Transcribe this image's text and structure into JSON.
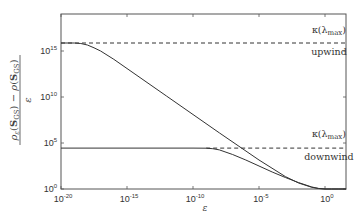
{
  "chart_data": {
    "type": "line",
    "title": "",
    "xlabel": "ε",
    "ylabel": "(ρ_ε(S_GS) − ρ(S_GS)) / ε",
    "xscale": "log",
    "yscale": "log",
    "xlim_exp": [
      -20,
      1.6
    ],
    "ylim_exp": [
      0,
      19
    ],
    "grid": false,
    "x_ticks": [
      {
        "exp": -20,
        "label": "10",
        "sup": "-20"
      },
      {
        "exp": -15,
        "label": "10",
        "sup": "-15"
      },
      {
        "exp": -10,
        "label": "10",
        "sup": "-10"
      },
      {
        "exp": -5,
        "label": "10",
        "sup": "-5"
      },
      {
        "exp": 0,
        "label": "10",
        "sup": "0"
      }
    ],
    "y_ticks": [
      {
        "exp": 0,
        "label": "10",
        "sup": "0"
      },
      {
        "exp": 5,
        "label": "10",
        "sup": "5"
      },
      {
        "exp": 10,
        "label": "10",
        "sup": "10"
      },
      {
        "exp": 15,
        "label": "10",
        "sup": "15"
      }
    ],
    "series": [
      {
        "name": "upwind",
        "style": "solid",
        "log_x": [
          -20,
          -19,
          -18.5,
          -18,
          -17.5,
          -17,
          -16,
          -15,
          -12,
          -10,
          -8,
          -5,
          -3,
          -2,
          -1,
          -0.5,
          0,
          0.5,
          1,
          1.6
        ],
        "log_y": [
          15.87,
          15.87,
          15.82,
          15.65,
          15.35,
          15.0,
          14.1,
          13.1,
          10.1,
          8.1,
          6.1,
          3.15,
          1.35,
          0.65,
          0.18,
          0.05,
          0.0,
          0.0,
          0.0,
          0.0
        ]
      },
      {
        "name": "downwind",
        "style": "solid",
        "log_x": [
          -20,
          -15,
          -10,
          -9,
          -8.5,
          -8,
          -7,
          -6,
          -5,
          -4,
          -3,
          -2,
          -1,
          -0.5,
          0,
          0.5,
          1,
          1.6
        ],
        "log_y": [
          4.45,
          4.45,
          4.45,
          4.43,
          4.38,
          4.25,
          3.75,
          3.15,
          2.5,
          1.85,
          1.25,
          0.7,
          0.22,
          0.07,
          0.0,
          0.0,
          0.0,
          0.0
        ]
      },
      {
        "name": "κ(λmax) upwind",
        "style": "dashed",
        "log_x": [
          -20,
          1.6
        ],
        "log_y": [
          15.87,
          15.87
        ]
      },
      {
        "name": "κ(λmax) downwind",
        "style": "dashed",
        "log_x": [
          -9,
          1.6
        ],
        "log_y": [
          4.45,
          4.45
        ]
      }
    ],
    "annotations": [
      {
        "text": "κ(λ",
        "sub": "max",
        "close": ")",
        "log_x": 0.3,
        "log_y": 17.0,
        "anchor": "middle",
        "role": "upwind-kappa-label"
      },
      {
        "text": "upwind",
        "log_x": 0.3,
        "log_y": 14.6,
        "anchor": "middle",
        "role": "upwind-label"
      },
      {
        "text": "κ(λ",
        "sub": "max",
        "close": ")",
        "log_x": 0.3,
        "log_y": 5.6,
        "anchor": "middle",
        "role": "downwind-kappa-label"
      },
      {
        "text": "downwind",
        "log_x": 0.3,
        "log_y": 3.2,
        "anchor": "middle",
        "role": "downwind-label"
      }
    ]
  },
  "colors": {
    "line": "#333333",
    "axis": "#555555",
    "text": "#333333"
  }
}
